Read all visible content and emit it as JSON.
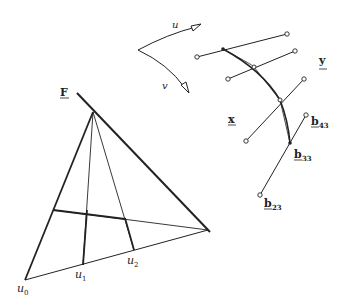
{
  "diagram": {
    "labels": {
      "F": "F",
      "u0": "u",
      "u0_sub": "0",
      "u1": "u",
      "u1_sub": "1",
      "u2": "u",
      "u2_sub": "2",
      "u_dir": "u",
      "v_dir": "v",
      "x": "x",
      "y": "y",
      "b43": "b",
      "b43_sub": "43",
      "b33": "b",
      "b33_sub": "33",
      "b23": "b",
      "b23_sub": "23"
    },
    "colors": {
      "stroke": "#222222",
      "background": "#ffffff"
    }
  }
}
